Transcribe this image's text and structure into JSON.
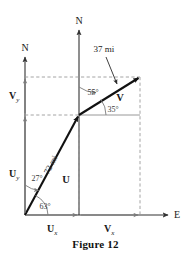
{
  "figure": {
    "caption": "Figure 12",
    "axes": {
      "north_main_label": "N",
      "north_secondary_label": "N",
      "east_label": "E"
    },
    "vectors": [
      {
        "name": "U",
        "label": "U",
        "magnitude_label": "72 mi",
        "bearing_angle_label": "27°",
        "elevation_angle_label": "63°",
        "x_component_label": "U",
        "x_component_sub": "x",
        "y_component_label": "U",
        "y_component_sub": "y",
        "color": "#111111"
      },
      {
        "name": "V",
        "label": "V",
        "magnitude_label": "37 mi",
        "bearing_angle_label": "55°",
        "elevation_angle_label": "35°",
        "x_component_label": "V",
        "x_component_sub": "x",
        "y_component_label": "V",
        "y_component_sub": "y",
        "color": "#111111"
      }
    ],
    "colors": {
      "vector_stroke": "#111111",
      "axis_stroke": "#333333",
      "guide_stroke": "#8c8c8c",
      "dashed_stroke": "#9a9a9a",
      "text": "#1a1a1a",
      "background": "#ffffff"
    }
  }
}
